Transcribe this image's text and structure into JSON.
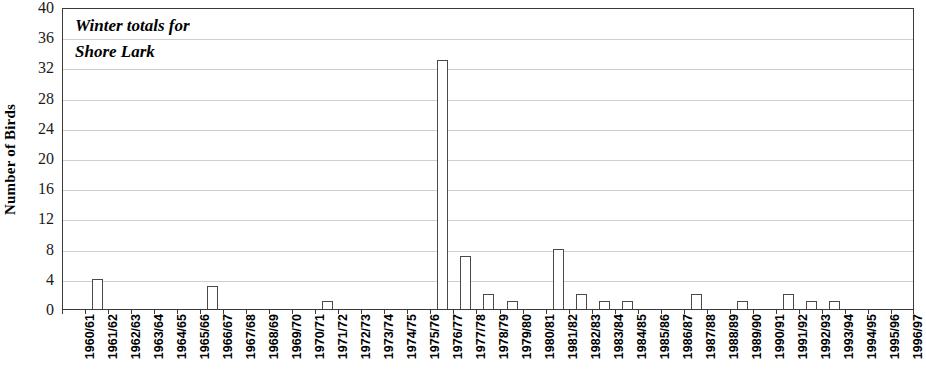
{
  "chart_data": {
    "type": "bar",
    "title_lines": [
      "Winter totals for",
      "Shore Lark"
    ],
    "xlabel": "",
    "ylabel": "Number of Birds",
    "ylim": [
      0,
      40
    ],
    "ytick_step": 4,
    "yticks": [
      0,
      4,
      8,
      12,
      16,
      20,
      24,
      28,
      32,
      36,
      40
    ],
    "grid": true,
    "grid_axis": "y",
    "legend": null,
    "bar_fill_color": "#ffffff",
    "bar_edge_color": "#4a4a4a",
    "grid_color": "#cfcfcf",
    "axis_color": "#3a3a3a",
    "categories": [
      "1960/61",
      "1961/62",
      "1962/63",
      "1963/64",
      "1964/65",
      "1965/66",
      "1966/67",
      "1967/68",
      "1968/69",
      "1969/70",
      "1970/71",
      "1971/72",
      "1972/73",
      "1973/74",
      "1974/75",
      "1975/76",
      "1976/77",
      "1977/78",
      "1978/79",
      "1979/80",
      "1980/81",
      "1981/82",
      "1982/83",
      "1983/84",
      "1984/85",
      "1985/86",
      "1986/87",
      "1987/88",
      "1988/89",
      "1989/90",
      "1990/91",
      "1991/92",
      "1992/93",
      "1993/94",
      "1994/95",
      "1995/96",
      "1996/97"
    ],
    "values": [
      0,
      4,
      0,
      0,
      0,
      0,
      3,
      0,
      0,
      0,
      0,
      1,
      0,
      0,
      0,
      0,
      33,
      7,
      2,
      1,
      0,
      8,
      2,
      1,
      1,
      0,
      0,
      2,
      0,
      1,
      0,
      2,
      1,
      1,
      0,
      0,
      0
    ]
  }
}
